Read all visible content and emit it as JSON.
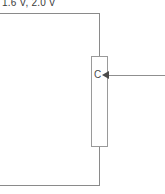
{
  "diagram": {
    "title_label": "1.6 V, 2.0 V",
    "component": {
      "label": "C",
      "type": "capacitor"
    },
    "colors": {
      "wire": "#8a8a8a",
      "component_outline": "#9a9a9a",
      "text": "#3a3a3a",
      "arrow": "#4a4a4a",
      "background": "#ffffff"
    }
  }
}
